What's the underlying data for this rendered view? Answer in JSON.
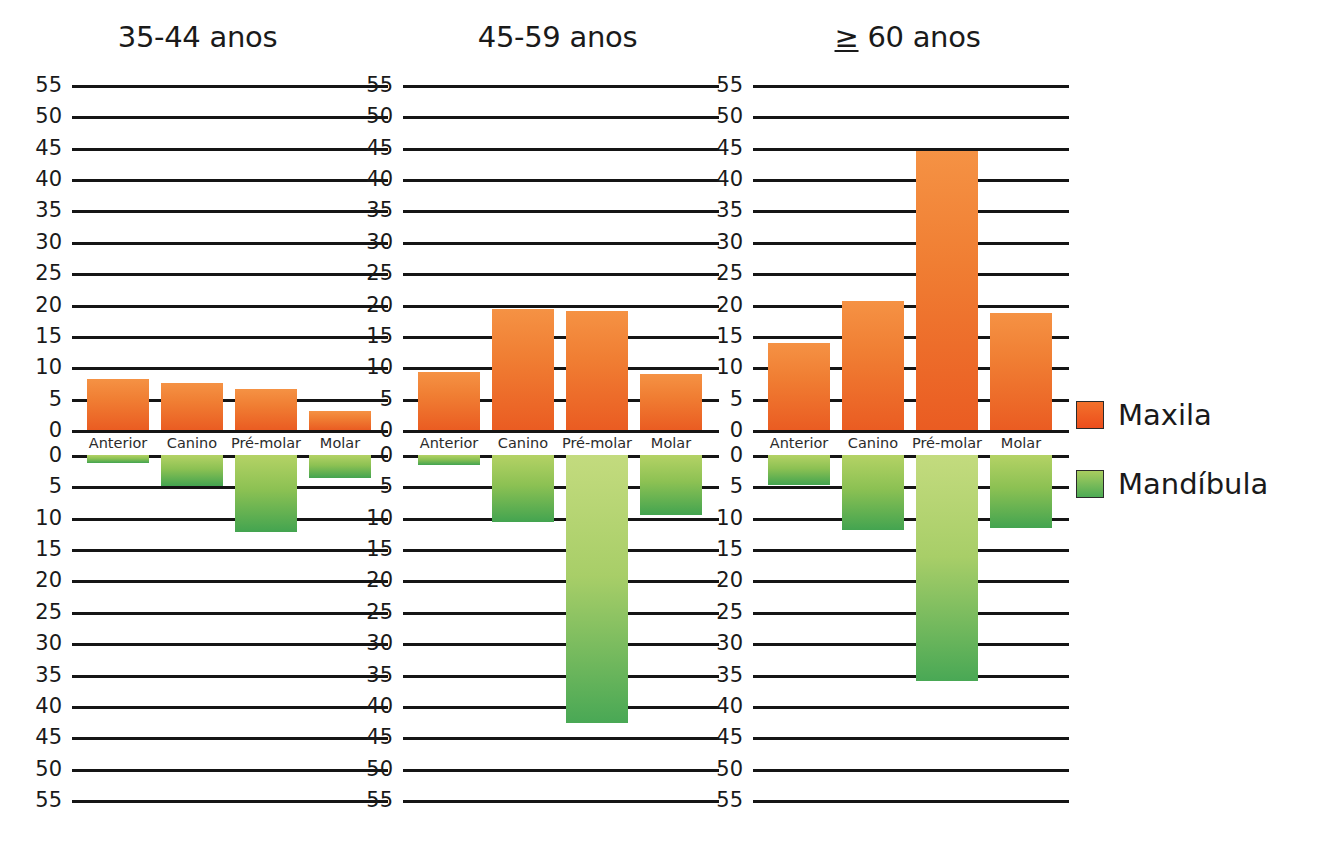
{
  "figure": {
    "background_color": "#ffffff",
    "axis_unit_step": 5
  },
  "legend": {
    "position": "right",
    "items": [
      {
        "label": "Maxila",
        "color": "#ec5a22",
        "swatch": "maxila-swatch"
      },
      {
        "label": "Mandíbula",
        "color": "#5cad55",
        "swatch": "mandibula-swatch"
      }
    ]
  },
  "chart_data": {
    "type": "bar",
    "title": "",
    "xlabel": "",
    "ylabel": "",
    "grid": true,
    "legend_position": "right",
    "orientation": "diverging-vertical",
    "categories": [
      "Anterior",
      "Canino",
      "Pré-molar",
      "Molar"
    ],
    "y_ticks_up": [
      0,
      5,
      10,
      15,
      20,
      25,
      30,
      35,
      40,
      45,
      50,
      55
    ],
    "y_ticks_down": [
      0,
      5,
      10,
      15,
      20,
      25,
      30,
      35,
      40,
      45,
      50,
      55
    ],
    "ylim_up": [
      0,
      55
    ],
    "ylim_down": [
      0,
      55
    ],
    "panels": [
      {
        "title": "35-44 anos",
        "series": [
          {
            "name": "Maxila",
            "direction": "up",
            "values": [
              8.2,
              7.5,
              6.5,
              3.0
            ]
          },
          {
            "name": "Mandíbula",
            "direction": "down",
            "values": [
              1.3,
              5.0,
              12.2,
              3.6
            ]
          }
        ]
      },
      {
        "title": "45-59 anos",
        "series": [
          {
            "name": "Maxila",
            "direction": "up",
            "values": [
              9.3,
              19.3,
              19.0,
              8.9
            ]
          },
          {
            "name": "Mandíbula",
            "direction": "down",
            "values": [
              1.6,
              10.7,
              42.8,
              9.6
            ]
          }
        ]
      },
      {
        "title": "≥ 60 anos",
        "title_prefix": "≥",
        "title_rest": " 60 anos",
        "series": [
          {
            "name": "Maxila",
            "direction": "up",
            "values": [
              13.9,
              20.6,
              44.4,
              18.7
            ]
          },
          {
            "name": "Mandíbula",
            "direction": "down",
            "values": [
              4.8,
              12.0,
              36.0,
              11.7
            ]
          }
        ]
      }
    ]
  }
}
